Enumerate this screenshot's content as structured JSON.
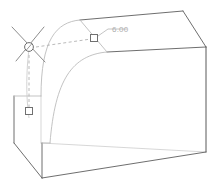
{
  "viewport": {
    "name": "3d-model-viewport",
    "background_color": "#ffffff",
    "width": 218,
    "height": 190
  },
  "model": {
    "shape_label": "box",
    "visible_edge_color": "#5a5a5a",
    "hidden_edge_color": "#cfcfcf",
    "feature_edge_color": "#b8b8b8",
    "feature_name": "fillet"
  },
  "fillet": {
    "dimension_value": "6.00",
    "dimension_color": "#aeaeae",
    "leader_color": "#b0b0b0",
    "handle_stroke": "#7a7a7a",
    "handle_fill": "#ffffff",
    "center_marker_name": "fillet-center-grip",
    "radius_handle_top_name": "fillet-radius-handle-top",
    "radius_handle_side_name": "fillet-radius-handle-side"
  }
}
